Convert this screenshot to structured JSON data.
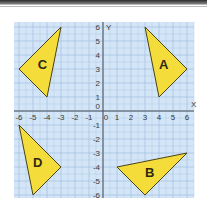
{
  "colors": {
    "grid_background": "#D3E5F6",
    "grid_line": "#A7C4E2",
    "axis": "#4a4f57",
    "triangle_fill": "#F4DD3A",
    "triangle_stroke": "#4a4218",
    "label_text": "#2e2a12"
  },
  "axes": {
    "x_label": "X",
    "y_label": "Y",
    "x_ticks": [
      "-6",
      "-5",
      "-4",
      "-3",
      "-2",
      "-1",
      "0",
      "1",
      "2",
      "3",
      "4",
      "5",
      "6"
    ],
    "y_ticks_positive": [
      "6",
      "5",
      "4",
      "3",
      "2",
      "1",
      "0"
    ],
    "y_ticks_negative": [
      "-1",
      "-2",
      "-3",
      "-4",
      "-5",
      "-6"
    ],
    "x_range": [
      -6,
      6
    ],
    "y_range": [
      -6,
      6
    ]
  },
  "shapes": [
    {
      "label": "A",
      "vertices": [
        [
          3,
          6
        ],
        [
          6,
          3
        ],
        [
          4,
          1
        ]
      ]
    },
    {
      "label": "B",
      "vertices": [
        [
          1,
          -4
        ],
        [
          6,
          -3
        ],
        [
          3,
          -6
        ]
      ]
    },
    {
      "label": "C",
      "vertices": [
        [
          -3,
          6
        ],
        [
          -6,
          3
        ],
        [
          -4,
          1
        ]
      ]
    },
    {
      "label": "D",
      "vertices": [
        [
          -6,
          -1
        ],
        [
          -3,
          -4
        ],
        [
          -5,
          -6
        ]
      ]
    }
  ]
}
